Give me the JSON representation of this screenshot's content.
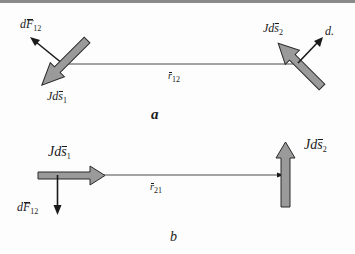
{
  "figure": {
    "part_a": {
      "label": "a",
      "force_label": {
        "prefix": "d",
        "vec": "F",
        "sub": "12"
      },
      "current1_label": {
        "prefix": "Jd",
        "vec": "s",
        "sub": "1"
      },
      "current2_label": {
        "prefix": "Jd",
        "vec": "s",
        "sub": "2"
      },
      "r_label": {
        "vec": "r",
        "sub": "12"
      },
      "d_label": "d."
    },
    "part_b": {
      "label": "b",
      "force_label": {
        "prefix": "d",
        "vec": "F",
        "sub": "12"
      },
      "current1_label": {
        "prefix": "Jd",
        "vec": "s",
        "sub": "1"
      },
      "current2_label": {
        "prefix": "Jd",
        "vec": "s",
        "sub": "2"
      },
      "r_label": {
        "vec": "r",
        "sub": "21"
      }
    }
  },
  "colors": {
    "arrow_fill": "#9a9a9a",
    "arrow_stroke": "#2a2a2a",
    "line": "#4a4a4a",
    "border": "#8a8a8a"
  }
}
